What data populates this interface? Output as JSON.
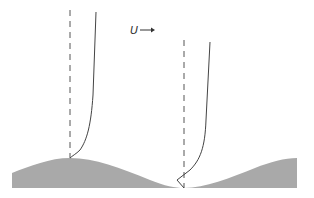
{
  "diagram": {
    "flow_label": "U",
    "flow_arrow": "→",
    "colors": {
      "ground_fill": "#a9a9a9",
      "profile_stroke": "#444444",
      "dashed_stroke": "#555555",
      "background": "#ffffff"
    },
    "ground": {
      "shape": "sinusoidal-wave",
      "crest_x": 70,
      "trough_x": 184
    },
    "profiles": [
      {
        "id": "crest-profile",
        "location": "over crest",
        "has_reversal": false
      },
      {
        "id": "trough-profile",
        "location": "over trough",
        "has_reversal": true
      }
    ]
  }
}
